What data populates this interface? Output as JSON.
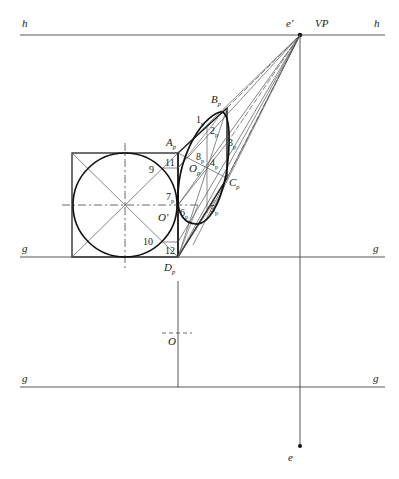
{
  "figure": {
    "labels": {
      "horizon_left": "h",
      "horizon_right": "h",
      "vanishing_point_eye": "e'",
      "vanishing_point": "VP",
      "ground_upper_left": "g",
      "ground_upper_right": "g",
      "ground_lower_left": "g",
      "ground_lower_right": "g",
      "eye_point": "e",
      "center_plan": "O",
      "center_front": "O'",
      "A": "A",
      "A_sub": "p",
      "B": "B",
      "B_sub": "p",
      "C": "C",
      "C_sub": "p",
      "D": "D",
      "D_sub": "p",
      "Op": "O",
      "Op_sub": "p",
      "p1": "1",
      "p1_sub": "p",
      "p2": "2",
      "p2_sub": "p",
      "p3": "3",
      "p3_sub": "p",
      "p4": "4",
      "p4_sub": "p",
      "p5": "5",
      "p5_sub": "p",
      "p6": "6",
      "p6_sub": "p",
      "p7": "7",
      "p7_sub": "p",
      "p8": "8",
      "p8_sub": "p",
      "n9": "9",
      "n10": "10",
      "n11": "11",
      "n12": "12"
    },
    "colors": {
      "line": "#333333",
      "thin_line": "#555555",
      "background": "#ffffff"
    }
  }
}
